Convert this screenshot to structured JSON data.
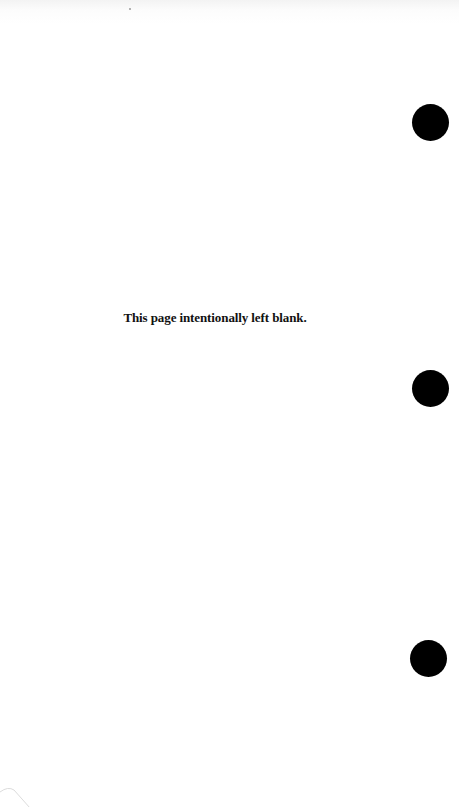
{
  "page": {
    "notice_text": "This page intentionally left blank.",
    "punch_holes": [
      {
        "cx": 430,
        "cy": 123
      },
      {
        "cx": 430,
        "cy": 389
      },
      {
        "cx": 428,
        "cy": 658
      }
    ],
    "colors": {
      "background": "#ffffff",
      "text": "#111111",
      "punch_hole": "#000000"
    }
  }
}
